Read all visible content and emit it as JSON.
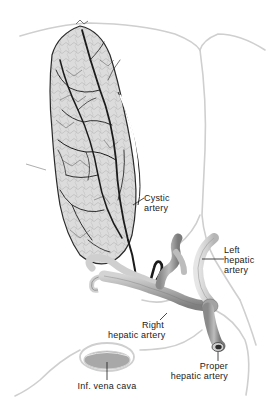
{
  "figure": {
    "colors": {
      "background": "#ffffff",
      "outline": "#c9c9c9",
      "vessel_fill": "#b9b9b9",
      "vessel_shade": "#8f8f8f",
      "vessel_dark": "#1b1b1b",
      "gallbladder_fill": "#d9d9d9",
      "label_text": "#1a1a1a",
      "vena_cava_fill": "#a8a8a8"
    }
  },
  "labels": {
    "cystic_artery": {
      "line1": "Cystic",
      "line2": "artery"
    },
    "left_hepatic_artery": {
      "line1": "Left",
      "line2": "hepatic",
      "line3": "artery"
    },
    "right_hepatic_artery": {
      "line1": "Right",
      "line2": "hepatic artery"
    },
    "proper_hepatic_artery": {
      "line1": "Proper",
      "line2": "hepatic artery"
    },
    "inf_vena_cava": {
      "line1": "Inf. vena cava"
    }
  }
}
